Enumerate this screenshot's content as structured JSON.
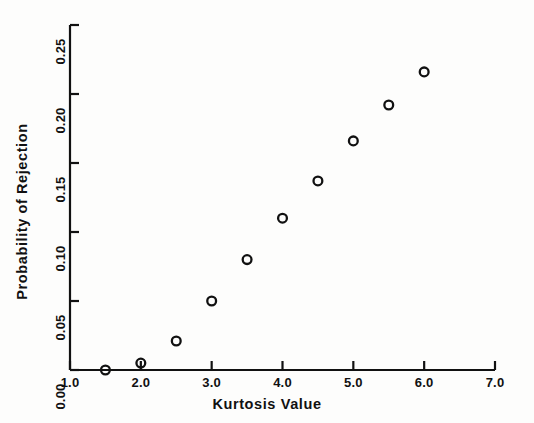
{
  "chart_data": {
    "type": "scatter",
    "title": "",
    "xlabel": "Kurtosis Value",
    "ylabel": "Probability of Rejection",
    "xlim": [
      1.0,
      7.0
    ],
    "ylim": [
      0.0,
      0.25
    ],
    "xticks": [
      "1.0",
      "2.0",
      "3.0",
      "4.0",
      "5.0",
      "6.0",
      "7.0"
    ],
    "xtick_values": [
      1.0,
      2.0,
      3.0,
      4.0,
      5.0,
      6.0,
      7.0
    ],
    "yticks": [
      "0.00",
      "0.05",
      "0.10",
      "0.15",
      "0.20",
      "0.25"
    ],
    "ytick_values": [
      0.0,
      0.05,
      0.1,
      0.15,
      0.2,
      0.25
    ],
    "grid": false,
    "legend": false,
    "marker": "open-circle",
    "marker_color": "#111111",
    "series": [
      {
        "name": "Probability of Rejection vs Kurtosis",
        "x": [
          1.5,
          2.0,
          2.5,
          3.0,
          3.5,
          4.0,
          4.5,
          5.0,
          5.5,
          6.0
        ],
        "values": [
          0.0,
          0.005,
          0.021,
          0.05,
          0.08,
          0.11,
          0.137,
          0.166,
          0.192,
          0.216
        ]
      }
    ]
  },
  "axes": {
    "x_title": "Kurtosis Value",
    "y_title": "Probability of Rejection"
  },
  "xtick_labels": [
    "1.0",
    "2.0",
    "3.0",
    "4.0",
    "5.0",
    "6.0",
    "7.0"
  ],
  "ytick_labels": [
    "0.00",
    "0.05",
    "0.10",
    "0.15",
    "0.20",
    "0.25"
  ],
  "colors": {
    "ink": "#111111",
    "background": "#fdfdfc"
  }
}
